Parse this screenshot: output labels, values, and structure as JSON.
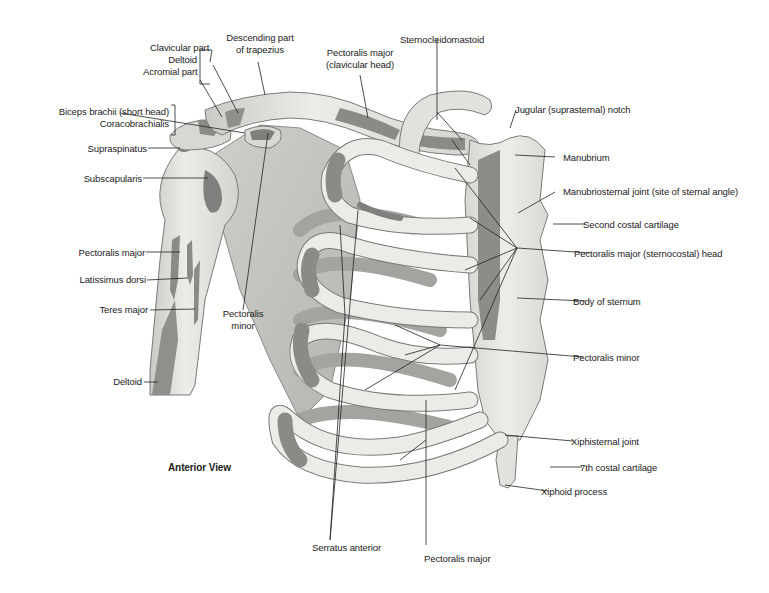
{
  "diagram": {
    "view_title": "Anterior View",
    "colors": {
      "bone": "#e6e6e3",
      "bone_shadow": "#b9b9b5",
      "muscle_attachment": "#7f7f7d",
      "outline": "#6e6e6b",
      "leader_line": "#222222",
      "text": "#222222"
    },
    "labels": {
      "deltoid_group": "Deltoid",
      "clavicular_part": "Clavicular part",
      "acromial_part": "Acromial part",
      "descending_trapezius": "Descending part\nof trapezius",
      "descending_trapezius_l1": "Descending part",
      "descending_trapezius_l2": "of trapezius",
      "pec_major_clavicular_l1": "Pectoralis major",
      "pec_major_clavicular_l2": "(clavicular head)",
      "sternocleidomastoid": "Sternocleidomastoid",
      "biceps_short_head": "Biceps brachii (short head)",
      "coracobrachialis": "Coracobrachialis",
      "supraspinatus": "Supraspinatus",
      "subscapularis": "Subscapularis",
      "jugular_notch": "Jugular (suprasternal) notch",
      "manubrium": "Manubrium",
      "manubriosternal_joint": "Manubriosternal joint (site of sternal angle)",
      "second_costal_cartilage": "Second costal cartilage",
      "pec_major_sternocostal": "Pectoralis major (sternocostal) head",
      "body_of_sternum": "Body of sternum",
      "pectoralis_minor_right": "Pectoralis minor",
      "pectoralis_major_arm": "Pectoralis major",
      "latissimus_dorsi": "Latissimus dorsi",
      "teres_major": "Teres major",
      "pectoralis_minor_center_l1": "Pectoralis",
      "pectoralis_minor_center_l2": "minor",
      "deltoid_arm": "Deltoid",
      "xiphisternal_joint": "Xiphisternal joint",
      "seventh_costal_cartilage": "7th costal cartilage",
      "xiphoid_process": "Xiphoid process",
      "serratus_anterior": "Serratus anterior",
      "pectoralis_major_bottom": "Pectoralis major"
    }
  }
}
